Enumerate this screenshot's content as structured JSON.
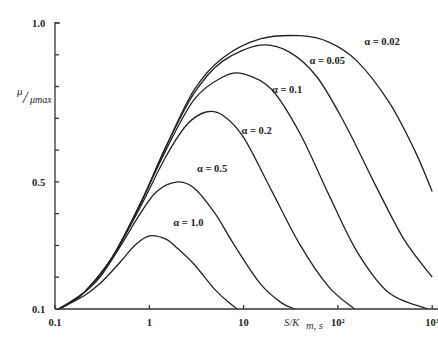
{
  "chart_data": {
    "type": "line",
    "title": "",
    "xlabel": "S/K_m,s",
    "ylabel": "μ/μmax",
    "xscale": "log",
    "xlim": [
      0.1,
      1000
    ],
    "ylim": [
      0.1,
      1.0
    ],
    "grid": false,
    "legend": "inline labels near each curve",
    "x_ticks": [
      {
        "value": 0.1,
        "label": "0.1"
      },
      {
        "value": 1,
        "label": "1"
      },
      {
        "value": 10,
        "label": "10"
      },
      {
        "value": 100,
        "label": "10²"
      },
      {
        "value": 1000,
        "label": "10³"
      }
    ],
    "y_ticks": [
      {
        "value": 0.1,
        "label": "0.1"
      },
      {
        "value": 0.2,
        "label": ""
      },
      {
        "value": 0.3,
        "label": ""
      },
      {
        "value": 0.4,
        "label": ""
      },
      {
        "value": 0.5,
        "label": "0.5"
      },
      {
        "value": 0.6,
        "label": ""
      },
      {
        "value": 0.7,
        "label": ""
      },
      {
        "value": 0.8,
        "label": ""
      },
      {
        "value": 0.9,
        "label": ""
      },
      {
        "value": 1.0,
        "label": "1.0"
      }
    ],
    "series": [
      {
        "name": "α = 1.0",
        "label_pos": [
          1.8,
          0.36
        ],
        "points": [
          [
            0.11,
            0.1
          ],
          [
            0.2,
            0.14
          ],
          [
            0.3,
            0.18
          ],
          [
            0.5,
            0.25
          ],
          [
            0.7,
            0.3
          ],
          [
            1.0,
            0.33
          ],
          [
            1.5,
            0.32
          ],
          [
            2,
            0.29
          ],
          [
            3,
            0.24
          ],
          [
            5,
            0.16
          ],
          [
            7,
            0.12
          ],
          [
            8.5,
            0.1
          ]
        ]
      },
      {
        "name": "α = 0.5",
        "label_pos": [
          3.2,
          0.53
        ],
        "points": [
          [
            0.11,
            0.1
          ],
          [
            0.2,
            0.15
          ],
          [
            0.3,
            0.2
          ],
          [
            0.5,
            0.3
          ],
          [
            0.8,
            0.4
          ],
          [
            1.2,
            0.47
          ],
          [
            2.0,
            0.5
          ],
          [
            3,
            0.48
          ],
          [
            5,
            0.4
          ],
          [
            8,
            0.3
          ],
          [
            15,
            0.18
          ],
          [
            25,
            0.12
          ],
          [
            35,
            0.1
          ]
        ]
      },
      {
        "name": "α = 0.2",
        "label_pos": [
          9.5,
          0.65
        ],
        "points": [
          [
            0.11,
            0.1
          ],
          [
            0.2,
            0.15
          ],
          [
            0.4,
            0.26
          ],
          [
            0.8,
            0.42
          ],
          [
            1.5,
            0.58
          ],
          [
            2.5,
            0.68
          ],
          [
            4,
            0.72
          ],
          [
            6,
            0.71
          ],
          [
            10,
            0.64
          ],
          [
            20,
            0.47
          ],
          [
            40,
            0.3
          ],
          [
            80,
            0.17
          ],
          [
            150,
            0.1
          ]
        ]
      },
      {
        "name": "α = 0.1",
        "label_pos": [
          20,
          0.78
        ],
        "points": [
          [
            0.11,
            0.1
          ],
          [
            0.2,
            0.15
          ],
          [
            0.4,
            0.26
          ],
          [
            0.8,
            0.43
          ],
          [
            1.5,
            0.6
          ],
          [
            3,
            0.76
          ],
          [
            6,
            0.83
          ],
          [
            10,
            0.84
          ],
          [
            20,
            0.79
          ],
          [
            40,
            0.65
          ],
          [
            80,
            0.46
          ],
          [
            160,
            0.28
          ],
          [
            350,
            0.15
          ],
          [
            900,
            0.1
          ]
        ]
      },
      {
        "name": "α = 0.05",
        "label_pos": [
          50,
          0.87
        ],
        "points": [
          [
            0.11,
            0.1
          ],
          [
            0.2,
            0.15
          ],
          [
            0.4,
            0.26
          ],
          [
            0.8,
            0.43
          ],
          [
            1.5,
            0.61
          ],
          [
            3,
            0.78
          ],
          [
            6,
            0.88
          ],
          [
            15,
            0.93
          ],
          [
            30,
            0.91
          ],
          [
            60,
            0.83
          ],
          [
            120,
            0.68
          ],
          [
            250,
            0.49
          ],
          [
            500,
            0.32
          ],
          [
            1000,
            0.2
          ]
        ]
      },
      {
        "name": "α = 0.02",
        "label_pos": [
          190,
          0.93
        ],
        "points": [
          [
            0.11,
            0.1
          ],
          [
            0.2,
            0.15
          ],
          [
            0.4,
            0.26
          ],
          [
            0.8,
            0.43
          ],
          [
            1.5,
            0.61
          ],
          [
            3,
            0.79
          ],
          [
            6,
            0.89
          ],
          [
            15,
            0.95
          ],
          [
            40,
            0.96
          ],
          [
            80,
            0.94
          ],
          [
            160,
            0.88
          ],
          [
            350,
            0.75
          ],
          [
            650,
            0.6
          ],
          [
            1000,
            0.47
          ]
        ]
      }
    ]
  },
  "axes": {
    "y_label_main": "μ",
    "y_label_sub": "μmax",
    "x_label": "S/K",
    "x_label_sub": "m, s"
  }
}
